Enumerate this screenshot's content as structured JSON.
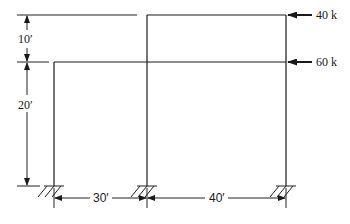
{
  "diagram": {
    "type": "two-story rigid frame with fixed supports",
    "loads": [
      {
        "label": "40 k",
        "level": "roof",
        "direction": "left"
      },
      {
        "label": "60 k",
        "level": "second floor",
        "direction": "left"
      }
    ],
    "vertical_dimensions": [
      {
        "label": "10′",
        "span": "between roof and second floor"
      },
      {
        "label": "20′",
        "span": "between second floor and base"
      }
    ],
    "horizontal_dimensions": [
      {
        "label": "30′",
        "span": "left column to middle column"
      },
      {
        "label": "40′",
        "span": "middle column to right column"
      }
    ],
    "supports": [
      "fixed",
      "fixed",
      "fixed"
    ],
    "colors": {
      "line": "#1a1a1a",
      "background": "#ffffff"
    }
  }
}
